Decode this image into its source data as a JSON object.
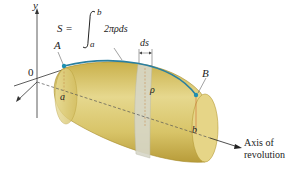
{
  "figure": {
    "formula": {
      "lhs": "S =",
      "integral_upper": "b",
      "integral_lower": "a",
      "integrand": "2πρds"
    },
    "labels": {
      "y_axis": "y",
      "origin": "0",
      "point_a": "A",
      "point_b": "B",
      "left_end": "a",
      "right_end": "b",
      "radius": "ρ",
      "arc_element": "ds",
      "axis_caption_line1": "Axis of",
      "axis_caption_line2": "revolution"
    },
    "colors": {
      "solid_fill": "#d9c56a",
      "solid_dark": "#b59a35",
      "band": "#d8d8cc",
      "curve": "#2a7fa0",
      "point": "#1f8fb0",
      "axis": "#333333"
    }
  }
}
